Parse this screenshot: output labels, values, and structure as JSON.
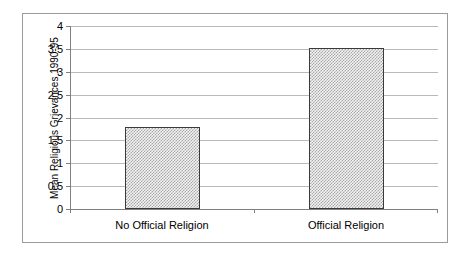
{
  "chart_data": {
    "type": "bar",
    "title": "",
    "xlabel": "",
    "ylabel": "Mean Religious Grievances 1990-95",
    "categories": [
      "No Official Religion",
      "Official Religion"
    ],
    "values": [
      1.8,
      3.52
    ],
    "ylim": [
      0,
      4
    ],
    "ytick_labels": [
      "0",
      "0.5",
      "1",
      "1.5",
      "2",
      "2.5",
      "3",
      "3.5",
      "4"
    ],
    "ytick_values": [
      0,
      0.5,
      1,
      1.5,
      2,
      2.5,
      3,
      3.5,
      4
    ],
    "grid": "horizontal",
    "legend": "none",
    "series": [
      {
        "name": "Mean Religious Grievances 1990-95",
        "values": [
          1.8,
          3.52
        ],
        "fill": "#c0c0c0",
        "border": "#3a3a3a"
      }
    ],
    "colors": {
      "bar_fill": "#c0c0c0",
      "bar_border": "#3a3a3a",
      "gridline": "#b9b9b9",
      "axis": "#808080",
      "frame": "#9a9a9a",
      "text": "#000000",
      "background": "#ffffff"
    }
  }
}
